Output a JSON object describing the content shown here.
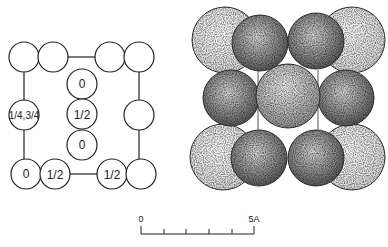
{
  "left_diagram": {
    "labels": {
      "center_top": "0",
      "center_mid": "1/2",
      "center_bottom": "0",
      "left_mid": "1/4,3/4",
      "bottom_left": "0",
      "bottom_second": "1/2",
      "bottom_third": "1/2"
    }
  },
  "scale_bar": {
    "start_label": "0",
    "end_label": "5A",
    "ticks": 5
  },
  "colors": {
    "line": "#222222",
    "light_sphere": "#e4e4e4",
    "dark_sphere": "#8a8a8a",
    "mid_sphere": "#b0b0b0"
  }
}
